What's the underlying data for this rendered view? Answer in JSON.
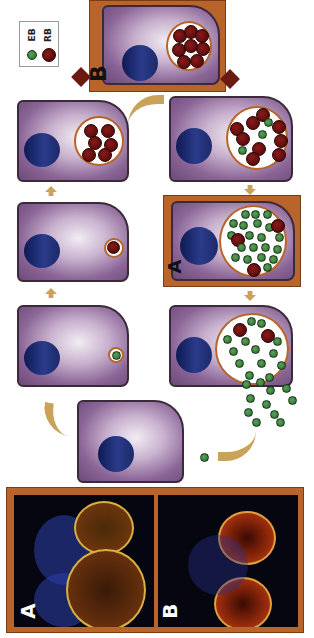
{
  "legend": {
    "items": [
      {
        "label": "EB",
        "color": "#2e7d32"
      },
      {
        "label": "RB",
        "color": "#6b0b0b"
      }
    ]
  },
  "panels": {
    "A_label": "A",
    "B_label": "B"
  },
  "micrographs": {
    "A_label": "A",
    "B_label": "B"
  },
  "colors": {
    "frame": "#b8642a",
    "cell": "#8a6596",
    "nucleus": "#1d2a6a",
    "eb": "#2e7d32",
    "rb": "#6b0b0b",
    "arrow": "#c9a35a",
    "dark_arrow": "#6b1a12"
  }
}
